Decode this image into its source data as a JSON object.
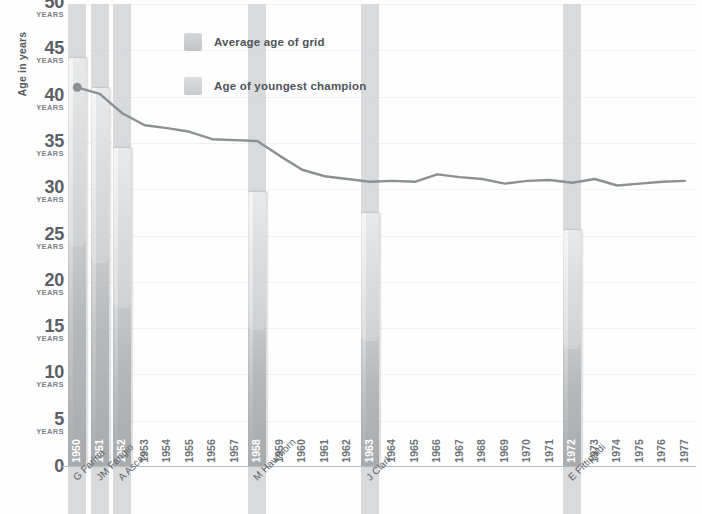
{
  "chart_data": {
    "type": "bar",
    "title": "",
    "xlabel": "",
    "ylabel": "Age in years",
    "ylim": [
      0,
      50
    ],
    "grid": true,
    "legend_position": "top-center",
    "y_ticks": [
      {
        "value": 50,
        "num": "50",
        "unit": "YEARS"
      },
      {
        "value": 45,
        "num": "45",
        "unit": "YEARS"
      },
      {
        "value": 40,
        "num": "40",
        "unit": "YEARS"
      },
      {
        "value": 35,
        "num": "35",
        "unit": "YEARS"
      },
      {
        "value": 30,
        "num": "30",
        "unit": "YEARS"
      },
      {
        "value": 25,
        "num": "25",
        "unit": "YEARS"
      },
      {
        "value": 20,
        "num": "20",
        "unit": "YEARS"
      },
      {
        "value": 15,
        "num": "15",
        "unit": "YEARS"
      },
      {
        "value": 10,
        "num": "10",
        "unit": "YEARS"
      },
      {
        "value": 5,
        "num": "5",
        "unit": "YEARS"
      },
      {
        "value": 0,
        "num": "0",
        "unit": ""
      }
    ],
    "categories": [
      "1950",
      "1951",
      "1952",
      "1953",
      "1954",
      "1955",
      "1956",
      "1957",
      "1958",
      "1959",
      "1960",
      "1961",
      "1962",
      "1963",
      "1964",
      "1965",
      "1966",
      "1967",
      "1968",
      "1969",
      "1970",
      "1971",
      "1972",
      "1973",
      "1974",
      "1975",
      "1976",
      "1977"
    ],
    "series": [
      {
        "name": "Age of youngest champion",
        "type": "bar",
        "color": "#c5c8ca",
        "values": [
          44.3,
          41.0,
          34.6,
          null,
          null,
          null,
          null,
          null,
          29.8,
          null,
          null,
          null,
          null,
          27.5,
          null,
          null,
          null,
          null,
          null,
          null,
          null,
          null,
          25.7,
          null,
          null,
          null,
          null,
          null
        ],
        "champion_years": [
          {
            "year": "1950",
            "driver": "G Farina",
            "age": 44.3
          },
          {
            "year": "1951",
            "driver": "JM Fangio",
            "age": 41.0
          },
          {
            "year": "1952",
            "driver": "A Ascari",
            "age": 34.6
          },
          {
            "year": "1958",
            "driver": "M Hawthorn",
            "age": 29.8
          },
          {
            "year": "1963",
            "driver": "J Clark",
            "age": 27.5
          },
          {
            "year": "1972",
            "driver": "E Fittipaldi",
            "age": 25.7
          }
        ]
      },
      {
        "name": "Average age of grid",
        "type": "line",
        "color": "#8b9093",
        "values": [
          41.0,
          40.3,
          38.2,
          36.9,
          36.6,
          36.2,
          35.4,
          35.3,
          35.2,
          33.6,
          32.1,
          31.4,
          31.1,
          30.8,
          30.9,
          30.8,
          31.6,
          31.3,
          31.1,
          30.6,
          30.9,
          31.0,
          30.7,
          31.1,
          30.4,
          30.6,
          30.8,
          30.9
        ]
      }
    ]
  },
  "legend": {
    "items": [
      {
        "label": "Average age of grid"
      },
      {
        "label": "Age of youngest champion"
      }
    ]
  }
}
